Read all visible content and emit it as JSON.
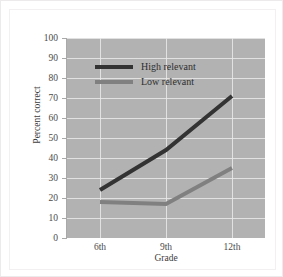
{
  "chart_data": {
    "type": "line",
    "title": "",
    "xlabel": "Grade",
    "ylabel": "Percent correct",
    "categories": [
      "6th",
      "9th",
      "12th"
    ],
    "ylim": [
      0,
      100
    ],
    "ytick_labels": [
      "100",
      "90",
      "80",
      "70",
      "60",
      "50",
      "40",
      "30",
      "20",
      "10",
      "0"
    ],
    "ytick_values": [
      100,
      90,
      80,
      70,
      60,
      50,
      40,
      30,
      20,
      10,
      0
    ],
    "grid": true,
    "legend_position": "upper-center",
    "series": [
      {
        "name": "High relevant",
        "values": [
          24,
          44,
          71
        ],
        "color": "#333333"
      },
      {
        "name": "Low relevant",
        "values": [
          18,
          17,
          35
        ],
        "color": "#808080"
      }
    ]
  },
  "style": {
    "plot_background": "#b2b2b2",
    "grid_color": "#e9e9e9",
    "figure_background": "#ffffff",
    "axis_color": "#a9a9a9",
    "tick_label_color": "#4a4a4a"
  }
}
